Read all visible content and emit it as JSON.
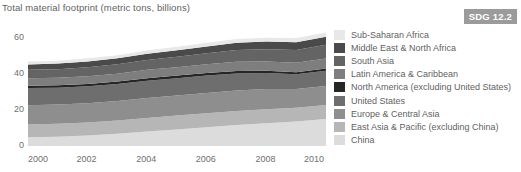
{
  "header": {
    "title": "Total material footprint (metric tons, billions)",
    "badge": "SDG 12.2",
    "badge_color": "#9b9b9b"
  },
  "chart_data": {
    "type": "area",
    "title": "Total material footprint (metric tons, billions)",
    "xlabel": "",
    "ylabel": "",
    "stacked": true,
    "grid": false,
    "legend_position": "right",
    "xlim": [
      2000,
      2010
    ],
    "ylim": [
      0,
      66
    ],
    "yticks": [
      0,
      20,
      40,
      60
    ],
    "xticks": [
      2000,
      2002,
      2004,
      2006,
      2008,
      2010
    ],
    "x": [
      2000,
      2001,
      2002,
      2003,
      2004,
      2005,
      2006,
      2007,
      2008,
      2009,
      2010
    ],
    "series": [
      {
        "name": "China",
        "color": "#dcdcdc",
        "values": [
          4.8,
          5.2,
          5.8,
          6.8,
          8.0,
          9.2,
          10.4,
          11.6,
          12.6,
          13.6,
          15.0
        ]
      },
      {
        "name": "East Asia & Pacific (excluding China)",
        "color": "#b6b6b6",
        "values": [
          7.2,
          7.2,
          7.3,
          7.4,
          7.6,
          7.7,
          7.8,
          7.9,
          7.8,
          7.6,
          7.8
        ]
      },
      {
        "name": "Europe & Central Asia",
        "color": "#8e8e8e",
        "values": [
          10.6,
          10.6,
          10.6,
          10.8,
          11.0,
          11.1,
          11.3,
          11.4,
          11.2,
          10.4,
          10.6
        ]
      },
      {
        "name": "United States",
        "color": "#6e6e6e",
        "values": [
          9.6,
          9.4,
          9.5,
          9.5,
          9.7,
          9.7,
          9.6,
          9.4,
          8.9,
          8.2,
          8.4
        ]
      },
      {
        "name": "North America (excluding United States)",
        "color": "#262626",
        "values": [
          1.3,
          1.3,
          1.3,
          1.3,
          1.4,
          1.4,
          1.4,
          1.4,
          1.3,
          1.2,
          1.3
        ]
      },
      {
        "name": "Latin America & Caribbean",
        "color": "#7e7e7e",
        "values": [
          4.2,
          4.2,
          4.3,
          4.4,
          4.6,
          4.7,
          4.9,
          5.1,
          5.2,
          5.2,
          5.5
        ]
      },
      {
        "name": "South Asia",
        "color": "#646464",
        "values": [
          4.6,
          4.8,
          5.0,
          5.2,
          5.5,
          5.8,
          6.1,
          6.5,
          6.8,
          7.2,
          7.6
        ]
      },
      {
        "name": "Middle East & North Africa",
        "color": "#4a4a4a",
        "values": [
          3.0,
          3.1,
          3.2,
          3.3,
          3.5,
          3.6,
          3.8,
          4.0,
          4.2,
          4.3,
          4.5
        ]
      },
      {
        "name": "Sub-Saharan Africa",
        "color": "#e8e8e8",
        "values": [
          1.6,
          1.6,
          1.7,
          1.7,
          1.8,
          1.9,
          2.0,
          2.1,
          2.2,
          2.3,
          2.4
        ]
      }
    ],
    "totals": [
      46.9,
      47.4,
      48.7,
      50.4,
      53.1,
      55.1,
      57.3,
      59.4,
      60.2,
      60.0,
      63.1
    ]
  },
  "legend": {
    "items": [
      {
        "label": "Sub-Saharan Africa",
        "color": "#e8e8e8"
      },
      {
        "label": "Middle East & North Africa",
        "color": "#4a4a4a"
      },
      {
        "label": "South Asia",
        "color": "#646464"
      },
      {
        "label": "Latin America & Caribbean",
        "color": "#7e7e7e"
      },
      {
        "label": "North America (excluding United States)",
        "color": "#262626"
      },
      {
        "label": "United States",
        "color": "#6e6e6e"
      },
      {
        "label": "Europe & Central Asia",
        "color": "#8e8e8e"
      },
      {
        "label": "East Asia & Pacific (excluding China)",
        "color": "#b6b6b6"
      },
      {
        "label": "China",
        "color": "#dcdcdc"
      }
    ]
  }
}
